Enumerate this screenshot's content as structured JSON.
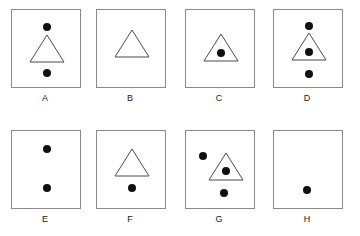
{
  "figure": {
    "type": "shape-matrix-puzzle",
    "rows": 2,
    "columns": 4,
    "box_stroke_color": "#8a8a8a",
    "triangle_stroke_color": "#4a4a4a",
    "dot_color": "#101010",
    "background_color": "#ffffff",
    "panels": [
      {
        "label": "A",
        "triangle": {
          "present": true,
          "width": 34,
          "height": 27,
          "cx": 35,
          "base_y": 52
        },
        "dots": [
          {
            "cx": 35,
            "cy": 17,
            "r": 4,
            "position": "above-triangle"
          },
          {
            "cx": 35,
            "cy": 63,
            "r": 4,
            "position": "below-triangle"
          }
        ]
      },
      {
        "label": "B",
        "triangle": {
          "present": true,
          "width": 34,
          "height": 27,
          "cx": 35,
          "base_y": 47
        },
        "dots": []
      },
      {
        "label": "C",
        "triangle": {
          "present": true,
          "width": 34,
          "height": 27,
          "cx": 35,
          "base_y": 51
        },
        "dots": [
          {
            "cx": 35,
            "cy": 43,
            "r": 4,
            "position": "inside-triangle"
          }
        ]
      },
      {
        "label": "D",
        "triangle": {
          "present": true,
          "width": 34,
          "height": 27,
          "cx": 35,
          "base_y": 50
        },
        "dots": [
          {
            "cx": 35,
            "cy": 16,
            "r": 4,
            "position": "above-triangle"
          },
          {
            "cx": 35,
            "cy": 42,
            "r": 4,
            "position": "inside-triangle"
          },
          {
            "cx": 35,
            "cy": 64,
            "r": 4,
            "position": "below-triangle"
          }
        ]
      },
      {
        "label": "E",
        "triangle": {
          "present": false
        },
        "dots": [
          {
            "cx": 35,
            "cy": 18,
            "r": 4,
            "position": "upper-center"
          },
          {
            "cx": 35,
            "cy": 57,
            "r": 4,
            "position": "lower-center"
          }
        ]
      },
      {
        "label": "F",
        "triangle": {
          "present": true,
          "width": 34,
          "height": 27,
          "cx": 35,
          "base_y": 45
        },
        "dots": [
          {
            "cx": 35,
            "cy": 57,
            "r": 4,
            "position": "below-triangle"
          }
        ]
      },
      {
        "label": "G",
        "triangle": {
          "present": true,
          "width": 34,
          "height": 27,
          "cx": 40,
          "base_y": 49
        },
        "dots": [
          {
            "cx": 17,
            "cy": 25,
            "r": 4,
            "position": "left-of-triangle"
          },
          {
            "cx": 40,
            "cy": 40,
            "r": 4,
            "position": "inside-triangle"
          },
          {
            "cx": 38,
            "cy": 62,
            "r": 4,
            "position": "below-triangle"
          }
        ]
      },
      {
        "label": "H",
        "triangle": {
          "present": false
        },
        "dots": [
          {
            "cx": 33,
            "cy": 59,
            "r": 4,
            "position": "lower-center"
          }
        ]
      }
    ]
  }
}
